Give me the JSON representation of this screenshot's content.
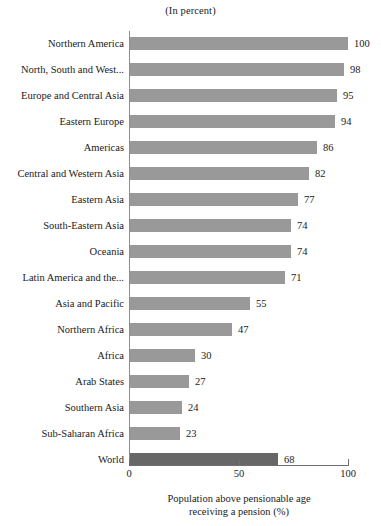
{
  "header": {
    "unit_note": "(In percent)"
  },
  "axis": {
    "x_title_line1": "Population above pensionable age",
    "x_title_line2": "receiving a pension (%)",
    "ticks": [
      "0",
      "50",
      "100"
    ]
  },
  "colors": {
    "bar": "#999999",
    "bar_highlight": "#676767",
    "axis": "#6f6f6f",
    "text": "#1a1a1a",
    "background": "#ffffff"
  },
  "chart_data": {
    "type": "bar",
    "orientation": "horizontal",
    "title": "",
    "subtitle": "(In percent)",
    "xlabel": "Population above pensionable age receiving a pension (%)",
    "ylabel": "",
    "xlim": [
      0,
      100
    ],
    "xticks": [
      0,
      50,
      100
    ],
    "grid": false,
    "legend": "none",
    "categories": [
      "Northern America",
      "North, South and West...",
      "Europe and Central Asia",
      "Eastern Europe",
      "Americas",
      "Central and Western Asia",
      "Eastern Asia",
      "South-Eastern Asia",
      "Oceania",
      "Latin America and the...",
      "Asia and Pacific",
      "Northern Africa",
      "Africa",
      "Arab States",
      "Southern Asia",
      "Sub-Saharan Africa",
      "World"
    ],
    "values": [
      100,
      98,
      95,
      94,
      86,
      82,
      77,
      74,
      74,
      71,
      55,
      47,
      30,
      27,
      24,
      23,
      68
    ],
    "highlight_category": "World",
    "bars": [
      {
        "label": "Northern America",
        "value": 100,
        "highlight": false
      },
      {
        "label": "North, South and West...",
        "value": 98,
        "highlight": false
      },
      {
        "label": "Europe and Central Asia",
        "value": 95,
        "highlight": false
      },
      {
        "label": "Eastern Europe",
        "value": 94,
        "highlight": false
      },
      {
        "label": "Americas",
        "value": 86,
        "highlight": false
      },
      {
        "label": "Central and Western Asia",
        "value": 82,
        "highlight": false
      },
      {
        "label": "Eastern Asia",
        "value": 77,
        "highlight": false
      },
      {
        "label": "South-Eastern Asia",
        "value": 74,
        "highlight": false
      },
      {
        "label": "Oceania",
        "value": 74,
        "highlight": false
      },
      {
        "label": "Latin America and the...",
        "value": 71,
        "highlight": false
      },
      {
        "label": "Asia and Pacific",
        "value": 55,
        "highlight": false
      },
      {
        "label": "Northern Africa",
        "value": 47,
        "highlight": false
      },
      {
        "label": "Africa",
        "value": 30,
        "highlight": false
      },
      {
        "label": "Arab States",
        "value": 27,
        "highlight": false
      },
      {
        "label": "Southern Asia",
        "value": 24,
        "highlight": false
      },
      {
        "label": "Sub-Saharan Africa",
        "value": 23,
        "highlight": false
      },
      {
        "label": "World",
        "value": 68,
        "highlight": true
      }
    ]
  }
}
